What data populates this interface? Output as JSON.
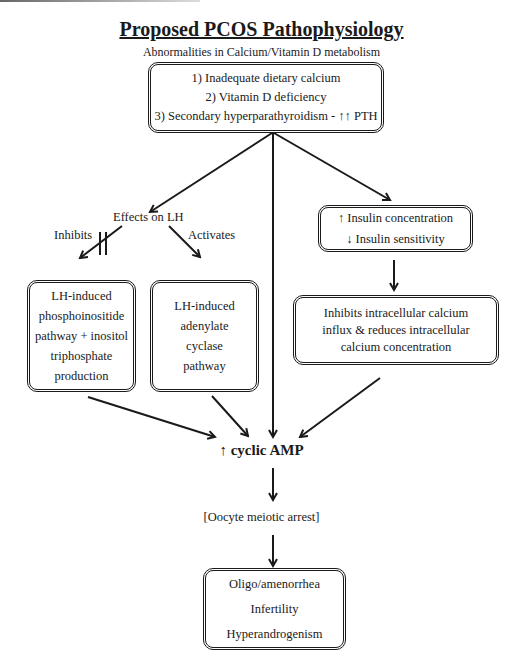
{
  "title": "Proposed PCOS Pathophysiology",
  "subtitle": "Abnormalities in Calcium/Vitamin D metabolism",
  "top_box": {
    "lines": [
      "1) Inadequate dietary calcium",
      "2) Vitamin D deficiency",
      "3) Secondary hyperparathyroidism - ↑↑ PTH"
    ]
  },
  "effects_on_lh": {
    "label": "Effects on LH",
    "inhibits_label": "Inhibits",
    "activates_label": "Activates"
  },
  "insulin_box": {
    "lines": [
      "↑ Insulin concentration",
      "↓ Insulin sensitivity"
    ]
  },
  "phosphoinositide_box": {
    "lines": [
      "LH-induced",
      "phosphoinositide",
      "pathway + inositol",
      "triphosphate",
      "production"
    ]
  },
  "adenylate_box": {
    "lines": [
      "LH-induced",
      "adenylate",
      "cyclase",
      "pathway"
    ]
  },
  "calcium_box": {
    "lines": [
      "Inhibits intracellular calcium",
      "influx & reduces intracellular",
      "calcium concentration"
    ]
  },
  "camp": "↑ cyclic AMP",
  "oocyte": "[Oocyte meiotic arrest]",
  "outcome_box": {
    "lines": [
      "Oligo/amenorrhea",
      "Infertility",
      "Hyperandrogenism"
    ]
  }
}
